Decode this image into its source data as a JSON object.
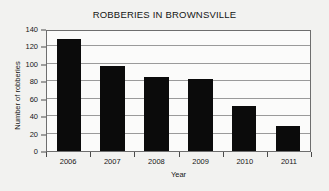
{
  "chart_data": {
    "type": "bar",
    "title": "ROBBERIES IN BROWNSVILLE",
    "xlabel": "Year",
    "ylabel": "Number of robberies",
    "categories": [
      "2006",
      "2007",
      "2008",
      "2009",
      "2010",
      "2011"
    ],
    "values": [
      129,
      97,
      85,
      83,
      52,
      29
    ],
    "ylim": [
      0,
      140
    ],
    "yticks": [
      0,
      20,
      40,
      60,
      80,
      100,
      120,
      140
    ],
    "ytick_labels": [
      "0",
      "20",
      "40",
      "60",
      "80",
      "100",
      "120",
      "140"
    ],
    "grid": "horizontal",
    "legend": "none",
    "bar_color": "#0b0b0b",
    "background_color": "#f2f2f0",
    "plot_background_color": "#fbfbfa",
    "gridline_color": "#9a9a9a",
    "frame_color": "#6e6e6e"
  }
}
